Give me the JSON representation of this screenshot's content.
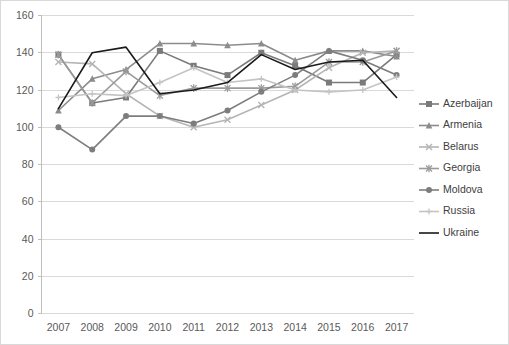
{
  "chart_data": {
    "type": "line",
    "title": "",
    "xlabel": "",
    "ylabel": "",
    "x": [
      2007,
      2008,
      2009,
      2010,
      2011,
      2012,
      2013,
      2014,
      2015,
      2016,
      2017
    ],
    "xtick_labels": [
      "2007",
      "2008",
      "2009",
      "2010",
      "2011",
      "2012",
      "2013",
      "2014",
      "2015",
      "2016",
      "2017"
    ],
    "ytick_labels": [
      "0",
      "20",
      "40",
      "60",
      "80",
      "100",
      "120",
      "140",
      "160"
    ],
    "yticks": [
      0,
      20,
      40,
      60,
      80,
      100,
      120,
      140,
      160
    ],
    "ylim": [
      0,
      160
    ],
    "grid": true,
    "legend_position": "right",
    "series": [
      {
        "name": "Azerbaijan",
        "marker": "square",
        "color": "#7a7a7a",
        "values": [
          139,
          113,
          116,
          141,
          133,
          128,
          140,
          133,
          124,
          124,
          139
        ]
      },
      {
        "name": "Armenia",
        "marker": "triangle",
        "color": "#8c8c8c",
        "values": [
          109,
          126,
          131,
          145,
          145,
          144,
          145,
          136,
          141,
          141,
          138
        ]
      },
      {
        "name": "Belarus",
        "marker": "x",
        "color": "#b5b5b5",
        "values": [
          135,
          134,
          118,
          106,
          100,
          104,
          112,
          120,
          132,
          140,
          141
        ]
      },
      {
        "name": "Georgia",
        "marker": "asterisk",
        "color": "#9a9a9a",
        "values": [
          139,
          113,
          130,
          117,
          121,
          121,
          121,
          122,
          135,
          135,
          141
        ]
      },
      {
        "name": "Moldova",
        "marker": "circle",
        "color": "#7d7d7d",
        "values": [
          100,
          88,
          106,
          106,
          102,
          109,
          119,
          128,
          141,
          136,
          128
        ]
      },
      {
        "name": "Russia",
        "marker": "plus",
        "color": "#c4c4c4",
        "values": [
          116,
          118,
          117,
          124,
          132,
          124,
          126,
          120,
          119,
          120,
          127
        ]
      },
      {
        "name": "Ukraine",
        "marker": "none",
        "color": "#1a1a1a",
        "values": [
          110,
          140,
          143,
          118,
          120,
          124,
          139,
          131,
          135,
          136,
          116
        ]
      }
    ]
  },
  "legend": {
    "entries": [
      "Azerbaijan",
      "Armenia",
      "Belarus",
      "Georgia",
      "Moldova",
      "Russia",
      "Ukraine"
    ]
  }
}
